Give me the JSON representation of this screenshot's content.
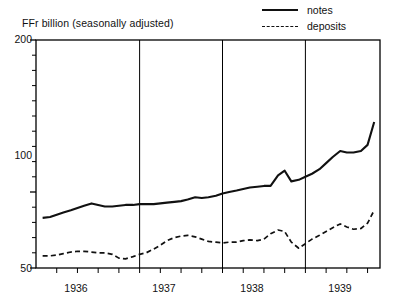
{
  "chart_data": {
    "type": "line",
    "title": "FFr billion (seasonally adjusted)",
    "xlabel": "",
    "ylabel": "FFr billion (seasonally adjusted)",
    "ylim": [
      50,
      200
    ],
    "xlim": [
      1935.75,
      1939.9
    ],
    "y_major_ticks": [
      50,
      100,
      200
    ],
    "y_major_tick_labels": [
      "50",
      "100",
      "200"
    ],
    "y_minor_tick_step": 10,
    "x_tick_labels": [
      "1936",
      "1937",
      "1938",
      "1939"
    ],
    "x_tick_positions": [
      1936.5,
      1937.5,
      1938.5,
      1939.5
    ],
    "gridlines": {
      "vertical_at": [
        1937.0,
        1938.0,
        1939.0
      ],
      "horizontal": false
    },
    "legend": {
      "position": "top-right",
      "entries": [
        {
          "name": "notes",
          "style": "solid"
        },
        {
          "name": "deposits",
          "style": "dashed"
        }
      ]
    },
    "x": [
      1935.83,
      1935.92,
      1936.0,
      1936.08,
      1936.17,
      1936.25,
      1936.33,
      1936.42,
      1936.5,
      1936.58,
      1936.67,
      1936.75,
      1936.83,
      1936.92,
      1937.0,
      1937.08,
      1937.17,
      1937.25,
      1937.33,
      1937.42,
      1937.5,
      1937.58,
      1937.67,
      1937.75,
      1937.83,
      1937.92,
      1938.0,
      1938.08,
      1938.17,
      1938.25,
      1938.33,
      1938.42,
      1938.5,
      1938.58,
      1938.67,
      1938.75,
      1938.83,
      1938.92,
      1939.0,
      1939.08,
      1939.17,
      1939.25,
      1939.33,
      1939.42,
      1939.5,
      1939.58,
      1939.67,
      1939.75,
      1939.83
    ],
    "series": [
      {
        "name": "notes",
        "style": "solid",
        "values": [
          83,
          83.5,
          85,
          86.5,
          88,
          89.5,
          91,
          92.5,
          91.5,
          90.5,
          90.5,
          91,
          91.5,
          91.5,
          92,
          92,
          92,
          92.5,
          93,
          93.5,
          94,
          95,
          96.5,
          96,
          96.5,
          97.5,
          99,
          100,
          101,
          102,
          103,
          103.5,
          104,
          104,
          111,
          114,
          107,
          108,
          110,
          112,
          115,
          119,
          123,
          127,
          126,
          126,
          127,
          131,
          146
        ]
      },
      {
        "name": "deposits",
        "style": "dashed",
        "values": [
          58,
          58,
          58.5,
          59.5,
          60.5,
          61,
          61,
          60.5,
          60,
          60,
          59,
          56.5,
          56,
          57.5,
          59,
          60,
          62.5,
          65,
          68,
          70,
          71,
          71.5,
          70.5,
          69,
          67.5,
          67,
          66.5,
          67,
          67,
          68,
          68.5,
          68,
          69,
          72.5,
          75,
          74,
          67,
          63,
          66,
          69,
          71.5,
          74,
          76.5,
          79,
          77,
          75.5,
          76,
          79.5,
          88
        ]
      }
    ]
  },
  "colors": {
    "line": "#111111",
    "frame": "#000000",
    "background": "#ffffff"
  }
}
